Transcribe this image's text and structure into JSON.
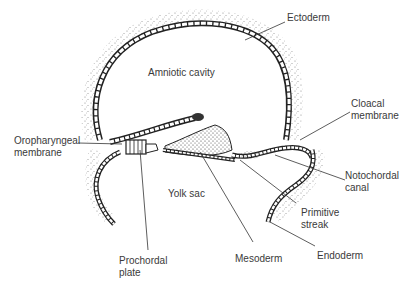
{
  "diagram": {
    "colors": {
      "ink": "#222222",
      "label": "#3a3a3a",
      "stipple": "#555555",
      "background": "#ffffff"
    },
    "labels": [
      {
        "id": "ectoderm",
        "lines": [
          "Ectoderm"
        ]
      },
      {
        "id": "amniotic-cavity",
        "lines": [
          "Amniotic cavity"
        ]
      },
      {
        "id": "cloacal-membrane",
        "lines": [
          "Cloacal",
          "membrane"
        ]
      },
      {
        "id": "oropharyngeal-membrane",
        "lines": [
          "Oropharyngeal",
          "membrane"
        ]
      },
      {
        "id": "notochordal-canal",
        "lines": [
          "Notochordal",
          "canal"
        ]
      },
      {
        "id": "yolk-sac",
        "lines": [
          "Yolk sac"
        ]
      },
      {
        "id": "primitive-streak",
        "lines": [
          "Primitive",
          "streak"
        ]
      },
      {
        "id": "prochordal-plate",
        "lines": [
          "Prochordal",
          "plate"
        ]
      },
      {
        "id": "mesoderm",
        "lines": [
          "Mesoderm"
        ]
      },
      {
        "id": "endoderm",
        "lines": [
          "Endoderm"
        ]
      }
    ]
  }
}
